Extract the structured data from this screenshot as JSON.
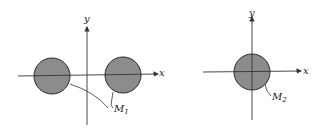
{
  "figures": [
    {
      "id": "left",
      "axes": {
        "x_label": "x",
        "y_label": "y"
      },
      "regions": [
        {
          "name": "disk-left",
          "cx": 52,
          "cy": 76,
          "r": 18
        },
        {
          "name": "disk-right",
          "cx": 123,
          "cy": 75,
          "r": 18
        }
      ],
      "region_label": {
        "base": "M",
        "subscript": "1"
      }
    },
    {
      "id": "right",
      "axes": {
        "x_label": "x",
        "y_label": "y"
      },
      "regions": [
        {
          "name": "disk-center",
          "cx": 252,
          "cy": 72,
          "r": 18
        }
      ],
      "region_label": {
        "base": "M",
        "subscript": "2"
      }
    }
  ],
  "colors": {
    "fill": "#8c8c8c",
    "stroke": "#2a2a2a",
    "axis": "#333333"
  }
}
